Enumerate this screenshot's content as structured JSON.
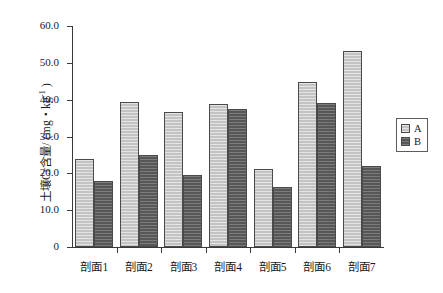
{
  "chart_data": {
    "type": "bar",
    "title": "",
    "xlabel": "",
    "ylabel": "土壤Cr含量/ (mg・kg-1)",
    "ylabel_parts": {
      "prefix": "土壤Cr含量/ (mg・kg",
      "exponent": "-1",
      "suffix": " )"
    },
    "categories": [
      "剖面1",
      "剖面2",
      "剖面3",
      "剖面4",
      "剖面5",
      "剖面6",
      "剖面7"
    ],
    "series": [
      {
        "name": "A",
        "color": "#c3c3c3",
        "values": [
          23.8,
          39.3,
          36.7,
          38.9,
          21.1,
          44.9,
          53.2
        ]
      },
      {
        "name": "B",
        "color": "#575757",
        "values": [
          17.8,
          25.1,
          19.5,
          37.5,
          16.2,
          39.0,
          22.1
        ]
      }
    ],
    "ylim": [
      0,
      60
    ],
    "ytick_values": [
      0,
      10,
      20,
      30,
      40,
      50,
      60
    ],
    "ytick_labels": [
      "0",
      "10.0",
      "20.0",
      "30.0",
      "40.0",
      "50.0",
      "60.0"
    ],
    "grid": false,
    "legend_position": "right"
  },
  "legend": {
    "entries": [
      {
        "label": "A",
        "color": "#c3c3c3"
      },
      {
        "label": "B",
        "color": "#575757"
      }
    ]
  },
  "colors": {
    "series_a": "#c3c3c3",
    "series_b": "#575757",
    "axis": "#3a3a3a",
    "background": "#ffffff"
  }
}
